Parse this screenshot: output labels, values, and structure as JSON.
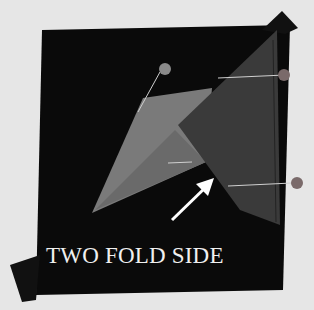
{
  "image": {
    "subject": "quilt block with pinned folded fabric triangles",
    "caption": "TWO FOLD SIDE",
    "colors": {
      "background": "#e6e6e6",
      "fabric_dark": "#0a0a0a",
      "triangle_light": "#7a7a7a",
      "triangle_dark": "#3a3a3a",
      "pin_head": "#8a8a8a",
      "arrow": "#ffffff"
    }
  }
}
